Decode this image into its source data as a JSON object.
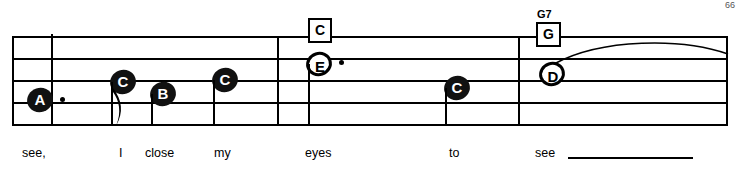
{
  "sheet": {
    "staff": {
      "line_count": 5,
      "left": 12,
      "width": 716,
      "top": 36,
      "spacing": 22
    },
    "notes": [
      {
        "letter": "A",
        "style": "filled",
        "x": 27,
        "y": 90,
        "dotted": true,
        "stem": "none"
      },
      {
        "letter": "C",
        "style": "filled",
        "x": 112,
        "y": 72,
        "dotted": false,
        "stem": "down-flag"
      },
      {
        "letter": "B",
        "style": "filled",
        "x": 152,
        "y": 84,
        "dotted": false,
        "stem": "down"
      },
      {
        "letter": "C",
        "style": "filled",
        "x": 213,
        "y": 70,
        "dotted": false,
        "stem": "down"
      },
      {
        "letter": "E",
        "style": "hollow",
        "x": 307,
        "y": 54,
        "dotted": true,
        "stem": "down"
      },
      {
        "letter": "C",
        "style": "filled",
        "x": 445,
        "y": 78,
        "dotted": false,
        "stem": "down"
      },
      {
        "letter": "D",
        "style": "hollow",
        "x": 540,
        "y": 64,
        "dotted": false,
        "stem": "none"
      }
    ],
    "chords": [
      {
        "name": "C",
        "x": 307,
        "y": 22,
        "small_label": ""
      },
      {
        "name": "G",
        "x": 538,
        "y": 22,
        "small_label": "G7"
      }
    ],
    "barlines": [
      {
        "x": 12,
        "y": 36,
        "height": 92
      },
      {
        "x": 277,
        "y": 36,
        "height": 92
      },
      {
        "x": 518,
        "y": 36,
        "height": 92
      },
      {
        "x": 727,
        "y": 36,
        "height": 92
      }
    ],
    "lyrics": [
      {
        "text": "see,",
        "x": 22,
        "y": 148
      },
      {
        "text": "I",
        "x": 119,
        "y": 148
      },
      {
        "text": "close",
        "x": 145,
        "y": 148
      },
      {
        "text": "my",
        "x": 214,
        "y": 148
      },
      {
        "text": "eyes",
        "x": 305,
        "y": 148
      },
      {
        "text": "to",
        "x": 449,
        "y": 148
      },
      {
        "text": "see",
        "x": 535,
        "y": 148
      }
    ],
    "lyric_extension": {
      "x": 568,
      "y": 158,
      "width": 125
    },
    "page_number": "66"
  }
}
